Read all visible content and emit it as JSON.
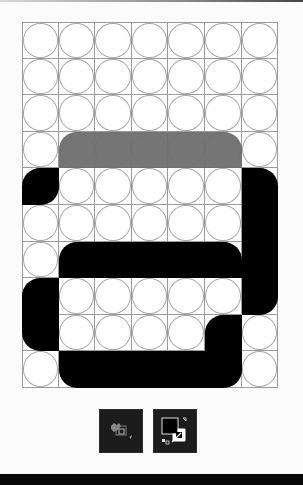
{
  "board": {
    "cols": 7,
    "rows": 10,
    "cell_size": 36.6,
    "grid_line_color": "#9a9a9a",
    "circle_color": "#a8a8a8",
    "pieces": [
      {
        "id": "gray-bar",
        "col": 1,
        "row": 3,
        "w": 5,
        "h": 1,
        "color": "#6e6e6e",
        "radii": [
          1,
          1,
          0,
          0
        ]
      },
      {
        "id": "black-corner-left",
        "col": 0,
        "row": 4,
        "w": 1,
        "h": 1,
        "color": "#000000",
        "radii": [
          1,
          0,
          1,
          0
        ]
      },
      {
        "id": "black-vertical-right",
        "col": 6,
        "row": 4,
        "w": 1,
        "h": 4,
        "color": "#000000",
        "radii": [
          0,
          1,
          1,
          0
        ]
      },
      {
        "id": "black-bar-middle",
        "col": 1,
        "row": 6,
        "w": 5,
        "h": 1,
        "color": "#000000",
        "radii": [
          1,
          1,
          0,
          0
        ]
      },
      {
        "id": "black-vertical-left",
        "col": 0,
        "row": 7,
        "w": 1,
        "h": 2,
        "color": "#000000",
        "radii": [
          1,
          0,
          0,
          1
        ]
      },
      {
        "id": "black-step",
        "col": 5,
        "row": 8,
        "w": 1,
        "h": 1,
        "color": "#000000",
        "radii": [
          1,
          0,
          0,
          0
        ]
      },
      {
        "id": "black-bar-bottom",
        "col": 1,
        "row": 9,
        "w": 5,
        "h": 1,
        "color": "#000000",
        "radii": [
          0,
          0,
          1,
          1
        ]
      }
    ]
  },
  "toolbar": {
    "buttons": [
      {
        "name": "color-picker-button",
        "icon": "paint-bucket-icon"
      },
      {
        "name": "fill-stroke-swap-button",
        "icon": "fill-stroke-icon"
      }
    ]
  },
  "colors": {
    "background": "#fbfbfb",
    "button_bg": "#1c1c1c",
    "bottom_bar": "#070707"
  }
}
